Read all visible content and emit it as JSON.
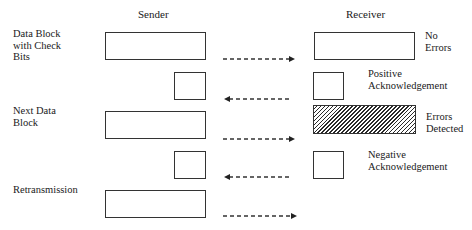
{
  "headers": {
    "sender": "Sender",
    "receiver": "Receiver"
  },
  "sender_labels": {
    "data_block": "Data Block\nwith Check\nBits",
    "next_data_block": "Next Data\nBlock",
    "retransmission": "Retransmission"
  },
  "receiver_labels": {
    "no_errors": "No\nErrors",
    "positive_ack": "Positive\nAcknowledgement",
    "errors_detected": "Errors\nDetected",
    "negative_ack": "Negative\nAcknowledgement"
  },
  "colors": {
    "line": "#333333",
    "background": "#ffffff"
  },
  "arrows": [
    {
      "direction": "right",
      "y": 59
    },
    {
      "direction": "left",
      "y": 99
    },
    {
      "direction": "right",
      "y": 139
    },
    {
      "direction": "left",
      "y": 177
    },
    {
      "direction": "right",
      "y": 216
    }
  ]
}
